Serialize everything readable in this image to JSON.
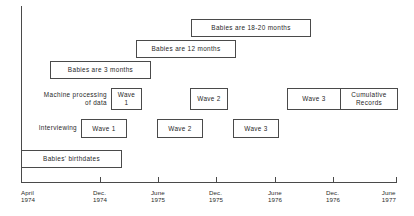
{
  "chart_data": {
    "type": "table",
    "title": "",
    "xlabel": "",
    "ylabel": "",
    "grid": false,
    "legend": "none",
    "axis": {
      "orientation": "horizontal-timeline",
      "start": "April 1974",
      "end": "June 1977",
      "ticks": [
        {
          "line1": "April",
          "line2": "1974",
          "x_px": 21
        },
        {
          "line1": "Dec.",
          "line2": "1974",
          "x_px": 100
        },
        {
          "line1": "June",
          "line2": "1975",
          "x_px": 158
        },
        {
          "line1": "Dec.",
          "line2": "1975",
          "x_px": 216
        },
        {
          "line1": "June",
          "line2": "1976",
          "x_px": 275
        },
        {
          "line1": "Dec.",
          "line2": "1976",
          "x_px": 333
        },
        {
          "line1": "June",
          "line2": "1977",
          "x_px": 396
        }
      ]
    },
    "row_labels": [
      {
        "text": "Machine processing\nof data",
        "x_px": 29,
        "y_px": 91,
        "width_px": 78
      },
      {
        "text": "Interviewing",
        "x_px": 29,
        "y_px": 124,
        "width_px": 48
      }
    ],
    "bars": [
      {
        "id": "babies-18-20-months",
        "label": "Babies are 18-20 months",
        "row": "age-band",
        "x_px": 191,
        "y_px": 19,
        "w_px": 120,
        "h_px": 18,
        "span": "Dec. 1975 - Dec. 1976"
      },
      {
        "id": "babies-12-months",
        "label": "Babies are 12 months",
        "row": "age-band",
        "x_px": 136,
        "y_px": 40,
        "w_px": 100,
        "h_px": 18,
        "span": "June 1975 - Feb. 1976"
      },
      {
        "id": "babies-3-months",
        "label": "Babies are 3 months",
        "row": "age-band",
        "x_px": 50,
        "y_px": 61,
        "w_px": 101,
        "h_px": 18,
        "span": "Sept. 1974 - May 1975"
      },
      {
        "id": "machine-wave-1",
        "label": "Wave\n1",
        "row": "machine-processing",
        "x_px": 111,
        "y_px": 88,
        "w_px": 31,
        "h_px": 22,
        "span": "Feb. 1975 - May 1975"
      },
      {
        "id": "machine-wave-2",
        "label": "Wave 2",
        "row": "machine-processing",
        "x_px": 190,
        "y_px": 88,
        "w_px": 38,
        "h_px": 22,
        "span": "Nov. 1975 - Feb. 1976"
      },
      {
        "id": "machine-wave-3",
        "label": "Wave 3",
        "row": "machine-processing",
        "x_px": 287,
        "y_px": 88,
        "w_px": 53,
        "h_px": 22,
        "span": "Aug. 1976 - Dec. 1976"
      },
      {
        "id": "machine-cumulative-records",
        "label": "Cumulative\nRecords",
        "row": "machine-processing",
        "x_px": 340,
        "y_px": 88,
        "w_px": 58,
        "h_px": 22,
        "span": "Dec. 1976 - June 1977"
      },
      {
        "id": "interviewing-wave-1",
        "label": "Wave 1",
        "row": "interviewing",
        "x_px": 81,
        "y_px": 119,
        "w_px": 46,
        "h_px": 19,
        "span": "Sept. 1974 - Feb. 1975"
      },
      {
        "id": "interviewing-wave-2",
        "label": "Wave 2",
        "row": "interviewing",
        "x_px": 157,
        "y_px": 119,
        "w_px": 46,
        "h_px": 19,
        "span": "June 1975 - Nov. 1975"
      },
      {
        "id": "interviewing-wave-3",
        "label": "Wave 3",
        "row": "interviewing",
        "x_px": 233,
        "y_px": 119,
        "w_px": 46,
        "h_px": 19,
        "span": "Mar. 1976 - Aug. 1976"
      },
      {
        "id": "babies-birthdates",
        "label": "Babies' birthdates",
        "row": "birthdates",
        "x_px": 21,
        "y_px": 150,
        "w_px": 101,
        "h_px": 18,
        "span": "April 1974 - Feb. 1975"
      }
    ],
    "colors": {
      "line": "#4a4a4a",
      "text": "#1f1f1f",
      "background": "#ffffff"
    }
  }
}
